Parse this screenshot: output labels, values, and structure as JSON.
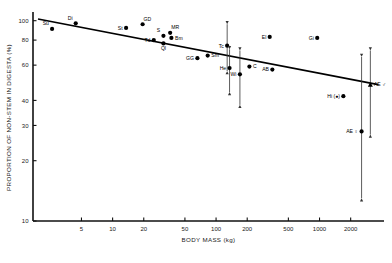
{
  "figure": {
    "type": "scatter-regression",
    "background": "#ffffff",
    "ink": "#000000"
  },
  "axes": {
    "y": {
      "title": "PROPORTION OF NON-STEM IN DIGESTA (%)",
      "scale": "log",
      "ticks": [
        100,
        80,
        60,
        40,
        30,
        20,
        10
      ],
      "tick_labels": [
        "100",
        "80",
        "60",
        "40",
        "30",
        "20",
        "10"
      ],
      "range": [
        10,
        108
      ]
    },
    "x": {
      "title": "BODY MASS (kg)",
      "scale": "log",
      "ticks": [
        5,
        10,
        20,
        50,
        100,
        200,
        500,
        1000,
        2000
      ],
      "tick_labels": [
        "5",
        "10",
        "20",
        "50",
        "100",
        "200",
        "500",
        "1000",
        "2000"
      ],
      "range": [
        1.7,
        4200
      ]
    },
    "grid": false,
    "legend": false
  },
  "chart_data": {
    "type": "scatter",
    "title": "",
    "subtitle": "",
    "xlabel": "BODY MASS (kg)",
    "ylabel": "PROPORTION OF NON-STEM IN DIGESTA (%)",
    "xscale": "log",
    "yscale": "log",
    "xlim": [
      1.7,
      4200
    ],
    "ylim": [
      10,
      108
    ],
    "grid": false,
    "legend_position": "none",
    "point_label_codes": [
      "Su",
      "Di",
      "St",
      "GD",
      "Td",
      "S",
      "MR",
      "Bm",
      "Ql",
      "GG",
      "Sm",
      "Tc",
      "He",
      "Wi",
      "C",
      "El",
      "AB",
      "Gi",
      "Hi",
      "AE male",
      "AE female"
    ],
    "points": [
      {
        "code": "Su",
        "label": "Su",
        "x": 2.6,
        "y": 91,
        "marker": "filled-circle",
        "label_pos": "above-left"
      },
      {
        "code": "Di",
        "label": "Di",
        "x": 4.4,
        "y": 97,
        "marker": "filled-circle",
        "label_pos": "above-left"
      },
      {
        "code": "St",
        "label": "St",
        "x": 13.5,
        "y": 92,
        "marker": "filled-circle",
        "label_pos": "left"
      },
      {
        "code": "GD",
        "label": "GD",
        "x": 19.5,
        "y": 96,
        "marker": "filled-circle",
        "label_pos": "above-right"
      },
      {
        "code": "Td",
        "label": "Td",
        "x": 25,
        "y": 80,
        "marker": "filled-circle",
        "label_pos": "left"
      },
      {
        "code": "S",
        "label": "S",
        "x": 31,
        "y": 84,
        "marker": "filled-circle",
        "label_pos": "above-left"
      },
      {
        "code": "MR",
        "label": "MR",
        "x": 36,
        "y": 87,
        "marker": "filled-circle",
        "label_pos": "above-right"
      },
      {
        "code": "Bm",
        "label": "Bm",
        "x": 37,
        "y": 82,
        "marker": "filled-circle",
        "label_pos": "right"
      },
      {
        "code": "Ql",
        "label": "Ql",
        "x": 31,
        "y": 77,
        "marker": "filled-circle",
        "label_pos": "below"
      },
      {
        "code": "GG",
        "label": "GG",
        "x": 66,
        "y": 65,
        "marker": "filled-circle",
        "label_pos": "left"
      },
      {
        "code": "Sm",
        "label": "Sm",
        "x": 83,
        "y": 67,
        "marker": "filled-circle",
        "label_pos": "right"
      },
      {
        "code": "Tc",
        "label": "Tc",
        "x": 128,
        "y": 75,
        "marker": "filled-circle",
        "label_pos": "left",
        "error_bar": {
          "low": 56,
          "high": 96
        }
      },
      {
        "code": "He",
        "label": "He",
        "x": 135,
        "y": 58,
        "marker": "filled-circle",
        "label_pos": "left",
        "error_bar": {
          "low": 44,
          "high": 72
        }
      },
      {
        "code": "Wi",
        "label": "Wi",
        "x": 170,
        "y": 54,
        "marker": "filled-circle",
        "label_pos": "left",
        "error_bar": {
          "low": 38,
          "high": 71
        }
      },
      {
        "code": "C",
        "label": "C",
        "x": 210,
        "y": 59,
        "marker": "filled-circle",
        "label_pos": "right"
      },
      {
        "code": "El",
        "label": "El",
        "x": 330,
        "y": 83,
        "marker": "filled-circle",
        "label_pos": "left"
      },
      {
        "code": "AB",
        "label": "AB",
        "x": 350,
        "y": 57,
        "marker": "filled-circle",
        "label_pos": "left"
      },
      {
        "code": "Gi",
        "label": "Gi",
        "x": 950,
        "y": 82,
        "marker": "filled-circle",
        "label_pos": "left"
      },
      {
        "code": "Hi",
        "label": "Hi (●)",
        "x": 1700,
        "y": 42,
        "marker": "filled-circle",
        "label_pos": "left"
      },
      {
        "code": "AE male",
        "label": "AE ♂",
        "x": 3100,
        "y": 48,
        "marker": "filled-triangle",
        "label_pos": "right",
        "error_bar": {
          "low": 27,
          "high": 71
        }
      },
      {
        "code": "AE female",
        "label": "AE ♀",
        "x": 2550,
        "y": 28,
        "marker": "filled-circle",
        "label_pos": "left",
        "error_bar": {
          "low": 13,
          "high": 66
        }
      }
    ],
    "regression_line": {
      "style": "solid",
      "x_start": 1.9,
      "y_start": 102,
      "x_end": 3700,
      "y_end": 48
    }
  }
}
